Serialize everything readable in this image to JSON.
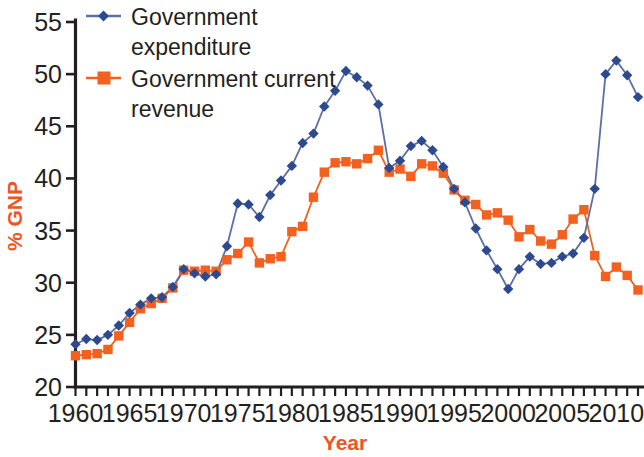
{
  "chart_data": {
    "type": "line",
    "title": "",
    "xlabel": "Year",
    "ylabel": "% GNP",
    "xlim": [
      1960,
      2012
    ],
    "ylim": [
      20,
      55
    ],
    "ytick_values": [
      20,
      25,
      30,
      35,
      40,
      45,
      50,
      55
    ],
    "ytick_labels": [
      "20",
      "25",
      "30",
      "35",
      "40",
      "45",
      "50",
      "55"
    ],
    "xtick_values": [
      1960,
      1965,
      1970,
      1975,
      1980,
      1985,
      1990,
      1995,
      2000,
      2005,
      2010
    ],
    "xtick_labels": [
      "1960",
      "1965",
      "1970",
      "1975",
      "1980",
      "1985",
      "1990",
      "1995",
      "2000",
      "2005",
      "2010"
    ],
    "minor_xticks_step": 1,
    "grid": false,
    "legend_position": "top-left",
    "x": [
      1960,
      1961,
      1962,
      1963,
      1964,
      1965,
      1966,
      1967,
      1968,
      1969,
      1970,
      1971,
      1972,
      1973,
      1974,
      1975,
      1976,
      1977,
      1978,
      1979,
      1980,
      1981,
      1982,
      1983,
      1984,
      1985,
      1986,
      1987,
      1988,
      1989,
      1990,
      1991,
      1992,
      1993,
      1994,
      1995,
      1996,
      1997,
      1998,
      1999,
      2000,
      2001,
      2002,
      2003,
      2004,
      2005,
      2006,
      2007,
      2008,
      2009,
      2010,
      2011,
      2012
    ],
    "series": [
      {
        "name": "Government expenditure",
        "color": "#2e4a8e",
        "line_color": "#5b6fa8",
        "marker": "diamond",
        "values": [
          24.1,
          24.6,
          24.5,
          25.0,
          25.9,
          27.1,
          27.9,
          28.5,
          28.6,
          29.6,
          31.3,
          30.9,
          30.6,
          30.8,
          33.5,
          37.6,
          37.5,
          36.3,
          38.4,
          39.8,
          41.2,
          43.4,
          44.3,
          46.9,
          48.4,
          50.3,
          49.7,
          48.9,
          47.1,
          41.0,
          41.7,
          43.1,
          43.6,
          42.7,
          41.1,
          39.0,
          37.7,
          35.2,
          33.1,
          31.3,
          29.4,
          31.3,
          32.5,
          31.8,
          31.9,
          32.5,
          32.8,
          34.3,
          39.0,
          50.0,
          51.3,
          49.9,
          47.8
        ]
      },
      {
        "name": "Government current revenue",
        "color": "#f4601f",
        "line_color": "#e8641f",
        "marker": "square",
        "values": [
          23.0,
          23.1,
          23.2,
          23.6,
          24.9,
          26.2,
          27.5,
          28.0,
          28.5,
          29.5,
          31.2,
          31.1,
          31.2,
          31.1,
          32.2,
          32.8,
          33.9,
          31.9,
          32.3,
          32.5,
          34.9,
          35.4,
          38.2,
          40.6,
          41.5,
          41.6,
          41.4,
          41.9,
          42.7,
          40.6,
          40.9,
          40.2,
          41.4,
          41.2,
          40.5,
          38.9,
          37.9,
          37.5,
          36.5,
          36.7,
          36.0,
          34.4,
          35.1,
          34.0,
          33.7,
          34.6,
          36.1,
          37.0,
          32.6,
          30.6,
          31.5,
          30.7,
          29.3
        ]
      }
    ]
  },
  "legend": {
    "items": [
      {
        "label_line1": "Government",
        "label_line2": "expenditure"
      },
      {
        "label_line1": "Government current",
        "label_line2": "revenue"
      }
    ]
  },
  "axes": {
    "y_title": "% GNP",
    "x_title": "Year"
  }
}
